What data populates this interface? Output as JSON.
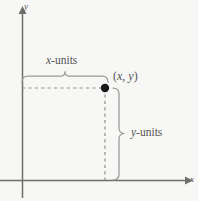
{
  "figure": {
    "background_color": "#f7f7f6",
    "line_color": "#9a9a99",
    "axis_color": "#6e6e6d",
    "text_color": "#555453",
    "point_color": "#1a1a1a"
  },
  "axes": {
    "y_axis_label": "y",
    "x_axis_label": "x",
    "origin": {
      "x": 22,
      "y": 180
    }
  },
  "point": {
    "label_open": "(",
    "label_x": "x",
    "label_comma": ", ",
    "label_y": "y",
    "label_close": ")",
    "coords": {
      "x": 105,
      "y": 88
    },
    "radius": 4.2
  },
  "braces": {
    "horizontal": {
      "label_var": "x",
      "label_rest": "-units",
      "start_x": 22,
      "end_x": 108,
      "y": 76
    },
    "vertical": {
      "label_var": "y",
      "label_rest": "-units",
      "x": 119,
      "start_y": 88,
      "end_y": 180
    }
  },
  "dashed_lines": {
    "horizontal_from_y_axis": {
      "x1": 22,
      "y1": 88,
      "x2": 105,
      "y2": 88
    },
    "vertical_to_x_axis": {
      "x1": 105,
      "y1": 88,
      "x2": 105,
      "y2": 180
    }
  }
}
